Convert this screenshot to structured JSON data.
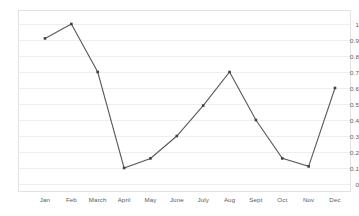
{
  "chart_data": {
    "type": "line",
    "title": "",
    "subtitle": "",
    "xlabel": "",
    "ylabel": "",
    "categories": [
      "Jan",
      "Feb",
      "March",
      "April",
      "May",
      "June",
      "July",
      "Aug",
      "Sept",
      "Oct",
      "Nov",
      "Dec"
    ],
    "series": [
      {
        "name": "",
        "values": [
          0.91,
          1.0,
          0.7,
          0.1,
          0.16,
          0.3,
          0.49,
          0.7,
          0.4,
          0.16,
          0.11,
          0.6
        ]
      }
    ],
    "ylim": [
      0,
      1
    ],
    "xlim": [
      0,
      11
    ],
    "yticks": [
      0,
      0.1,
      0.2,
      0.3,
      0.4,
      0.5,
      0.6,
      0.7,
      0.8,
      0.9,
      1
    ],
    "ytick_labels": [
      "0",
      "0.1",
      "0.2",
      "0.3",
      "0.4",
      "0.5",
      "0.6",
      "0.7",
      "0.8",
      "0.9",
      "1"
    ],
    "grid": true,
    "grid_axis": "y",
    "legend": false,
    "legend_position": "none",
    "markers": true,
    "line_color": "#595959",
    "marker_color": "#404040",
    "grid_color": "#eeeeee",
    "plot_border_color": "#e2e2e2",
    "background_color": "#ffffff",
    "tick_label_color": "#5a5a5a"
  }
}
